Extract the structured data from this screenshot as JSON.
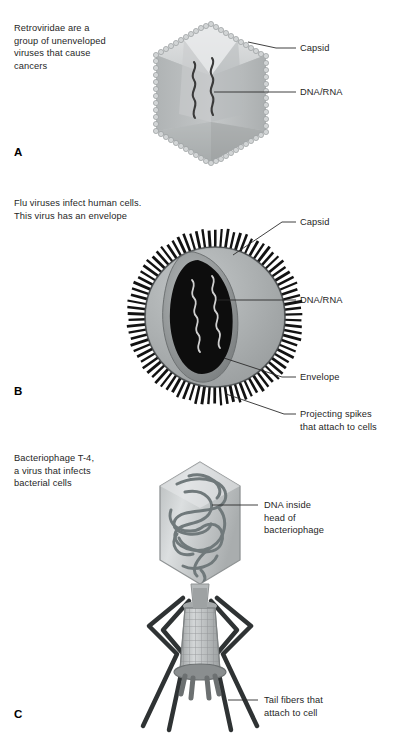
{
  "figure": {
    "title_alt": "Three types of viruses: unenveloped, enveloped, and bacteriophage",
    "background": "#ffffff",
    "text_color": "#1f1f1f",
    "leader_color": "#2b2b2b"
  },
  "panels": [
    {
      "letter": "A",
      "caption": "Retroviridae are a\ngroup of unenveloped\nviruses that cause\ncancers",
      "virus_name": "Retroviridae (unenveloped icosahedral virus)",
      "labels": [
        {
          "text": "Capsid",
          "name": "label-capsid-a"
        },
        {
          "text": "DNA/RNA",
          "name": "label-dna-rna-a"
        }
      ],
      "colors": {
        "capsid_fill": "#b9bcbd",
        "capsid_light": "#d5d8d9",
        "capsid_mid": "#c6c9ca",
        "capsid_dark": "#a8acad",
        "bead_fill": "#cfd2d3",
        "bead_stroke": "#9a9e9f",
        "nucleic_acid": "#3a3a3a"
      }
    },
    {
      "letter": "B",
      "caption": "Flu viruses infect human cells.\nThis virus has an envelope",
      "virus_name": "Influenza virus (enveloped virus)",
      "labels": [
        {
          "text": "Capsid",
          "name": "label-capsid-b"
        },
        {
          "text": "DNA/RNA",
          "name": "label-dna-rna-b"
        },
        {
          "text": "Envelope",
          "name": "label-envelope-b"
        },
        {
          "text": "Projecting spikes\nthat attach to cells",
          "name": "label-spikes-b"
        }
      ],
      "colors": {
        "envelope_outer": "#7f8384",
        "envelope_light": "#b4b8b9",
        "envelope_dark": "#5e6263",
        "capsid_rim": "#8d9192",
        "core_dark": "#0d0d0d",
        "spike": "#121212",
        "nucleic_acid": "#c9c9c9"
      },
      "spike_count": 86
    },
    {
      "letter": "C",
      "caption": "Bacteriophage T-4,\na virus that infects\nbacterial cells",
      "virus_name": "Bacteriophage T-4",
      "labels": [
        {
          "text": "DNA inside\nhead of\nbacteriophage",
          "name": "label-dna-head-c"
        },
        {
          "text": "Tail fibers that\nattach to cell",
          "name": "label-tail-fibers-c"
        }
      ],
      "colors": {
        "head_fill": "#c3c7c8",
        "head_light": "#dcdfe0",
        "head_edge": "#8f9394",
        "dna_strand": "#70797b",
        "sheath_fill": "#c9cccd",
        "sheath_grid": "#8b8f90",
        "collar": "#9fa3a4",
        "fiber": "#2f3334",
        "baseplate": "#7f8384"
      },
      "tail_fiber_count": 6
    }
  ]
}
